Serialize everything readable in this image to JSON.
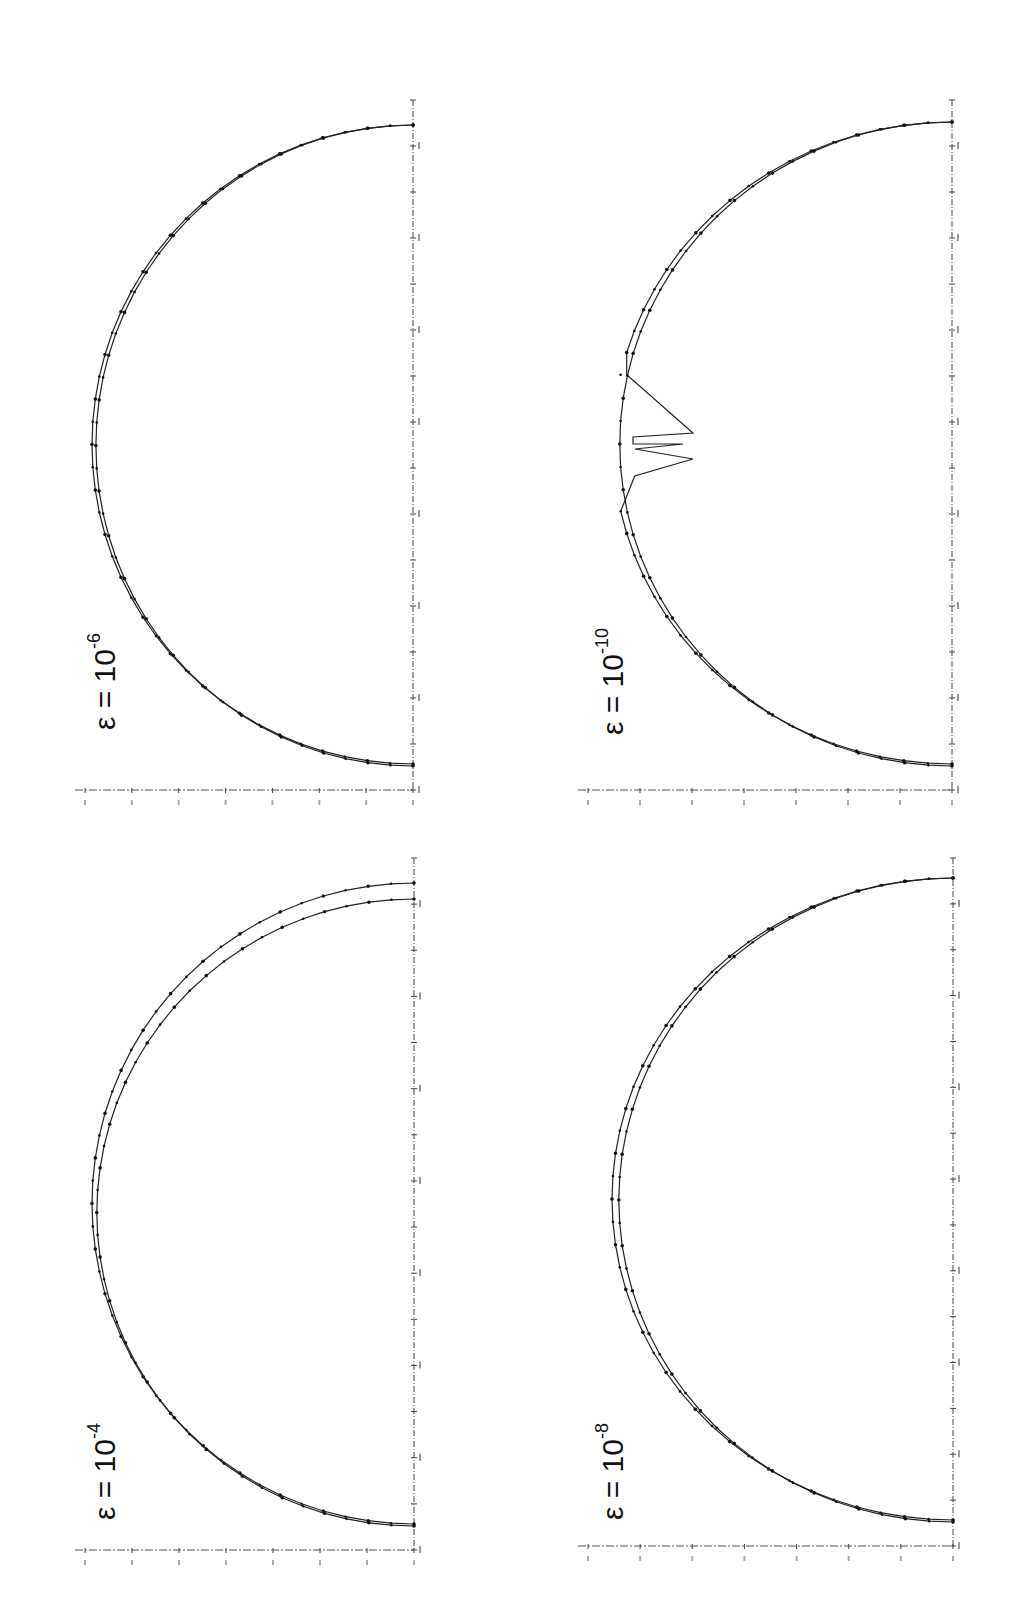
{
  "figure": {
    "orientation": "rotated-90-ccw",
    "panels": [
      {
        "id": "top-left",
        "epsilon_label": "ε  =  10",
        "epsilon_exp": "-6"
      },
      {
        "id": "top-right",
        "epsilon_label": "ε  =  10",
        "epsilon_exp": "-10"
      },
      {
        "id": "bottom-left",
        "epsilon_label": "ε  =  10",
        "epsilon_exp": "-4"
      },
      {
        "id": "bottom-right",
        "epsilon_label": "ε  =  10",
        "epsilon_exp": "-8"
      }
    ]
  },
  "chart_data": [
    {
      "type": "line",
      "title": "ε = 10^-4",
      "description": "Two nearly-semicircular profiles with dot markers; the two curves diverge slightly near one end (endpoint offsets differ).",
      "series": [
        {
          "name": "curve A",
          "shape": "semicircle",
          "end_offset": "larger"
        },
        {
          "name": "curve B",
          "shape": "semicircle",
          "end_offset": "smaller"
        }
      ],
      "xlabel": "",
      "ylabel": "",
      "grid": false,
      "tick_labels": "illegible"
    },
    {
      "type": "line",
      "title": "ε = 10^-6",
      "description": "Two nearly-coincident semicircular profiles with dot markers; slight separation along the arc.",
      "series": [
        {
          "name": "curve A",
          "shape": "semicircle"
        },
        {
          "name": "curve B",
          "shape": "semicircle"
        }
      ],
      "xlabel": "",
      "ylabel": "",
      "grid": false,
      "tick_labels": "illegible"
    },
    {
      "type": "line",
      "title": "ε = 10^-8",
      "description": "Two semicircular profiles with dot markers, mostly coincident with small separation near the apex.",
      "series": [
        {
          "name": "curve A",
          "shape": "semicircle"
        },
        {
          "name": "curve B",
          "shape": "semicircle"
        }
      ],
      "xlabel": "",
      "ylabel": "",
      "grid": false,
      "tick_labels": "illegible"
    },
    {
      "type": "line",
      "title": "ε = 10^-10",
      "description": "Two semicircular profiles; one curve develops spurious sawtooth spikes near the apex (numerical instability), the other remains smooth.",
      "series": [
        {
          "name": "curve A",
          "shape": "semicircle with 2-3 sharp spikes near apex"
        },
        {
          "name": "curve B",
          "shape": "semicircle"
        }
      ],
      "xlabel": "",
      "ylabel": "",
      "grid": false,
      "tick_labels": "illegible"
    }
  ]
}
